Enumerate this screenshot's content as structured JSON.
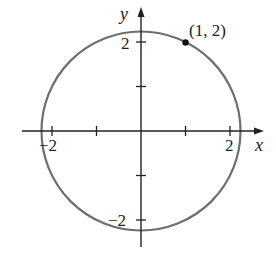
{
  "diagram": {
    "type": "circle-on-axes",
    "center": [
      0,
      0
    ],
    "radius_squared": 5,
    "axes": {
      "x_label": "x",
      "y_label": "y",
      "x_ticks": [
        -2,
        -1,
        1,
        2
      ],
      "y_ticks": [
        -2,
        -1,
        1,
        2
      ],
      "x_tick_labels": [
        {
          "value": -2,
          "text": "−2"
        },
        {
          "value": 2,
          "text": "2"
        }
      ],
      "y_tick_labels": [
        {
          "value": 2,
          "text": "2"
        },
        {
          "value": -2,
          "text": "−2"
        }
      ]
    },
    "point": {
      "x": 1,
      "y": 2,
      "label": "(1, 2)"
    },
    "colors": {
      "axis": "#222222",
      "circle": "#6e6e6e",
      "point": "#111111",
      "text": "#222222"
    }
  },
  "labels": {
    "x_axis": "x",
    "y_axis": "y",
    "x_tick_neg2": "−2",
    "x_tick_2": "2",
    "y_tick_2": "2",
    "y_tick_neg2": "−2",
    "point_label": "(1, 2)"
  }
}
